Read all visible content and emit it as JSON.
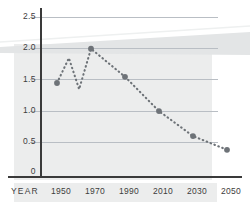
{
  "chart_data": {
    "type": "line",
    "title": "",
    "subtitle": "",
    "xlabel": "YEAR",
    "ylabel": "",
    "xlim": [
      1940,
      2056
    ],
    "ylim": [
      0,
      2.5
    ],
    "grid": true,
    "legend": null,
    "marker": "circle",
    "linestyle": "dotted",
    "series_color": "#6e7378",
    "x_tick_labels": [
      "1950",
      "1970",
      "1990",
      "2010",
      "2030",
      "2050"
    ],
    "x_ticks": [
      1950,
      1970,
      1990,
      2010,
      2030,
      2050
    ],
    "y_tick_labels": [
      "0",
      "0.5",
      "1.0",
      "1.5",
      "2.0",
      "2.5"
    ],
    "y_ticks": [
      0,
      0.5,
      1.0,
      1.5,
      2.0,
      2.5
    ],
    "series": [
      {
        "name": "series-1",
        "x": [
          1950,
          1957,
          1963,
          1970,
          1990,
          2010,
          2030,
          2050
        ],
        "values": [
          1.45,
          1.85,
          1.35,
          2.0,
          1.55,
          1.0,
          0.6,
          0.38
        ],
        "marker_x": [
          1950,
          1970,
          1990,
          2010,
          2030,
          2050
        ],
        "marker_values": [
          1.45,
          2.0,
          1.55,
          1.0,
          0.6,
          0.38
        ]
      }
    ]
  },
  "colors": {
    "background": "#ffffff",
    "panel": "#eceded",
    "gridline": "#b9bec4",
    "axis": "#3a3a3a",
    "text": "#3d3d3d",
    "series": "#6e7378",
    "wedge": "#e3e5e6"
  }
}
